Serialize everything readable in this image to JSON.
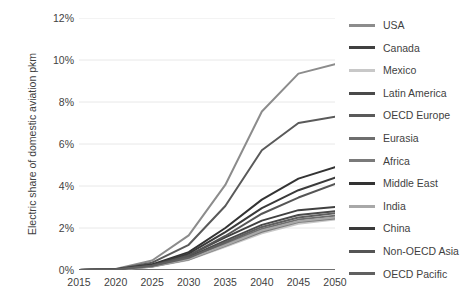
{
  "chart_data": {
    "type": "line",
    "title": "",
    "xlabel": "",
    "ylabel": "Electric share of domestic aviation pkm",
    "x": [
      2015,
      2020,
      2025,
      2030,
      2035,
      2040,
      2045,
      2050
    ],
    "xlim": [
      2015,
      2050
    ],
    "ylim": [
      0,
      12
    ],
    "y_ticks": [
      0,
      2,
      4,
      6,
      8,
      10,
      12
    ],
    "y_tick_labels": [
      "0%",
      "2%",
      "4%",
      "6%",
      "8%",
      "10%",
      "12%"
    ],
    "x_tick_labels": [
      "2015",
      "2020",
      "2025",
      "2030",
      "2035",
      "2040",
      "2045",
      "2050"
    ],
    "grid": "horizontal",
    "legend_position": "right",
    "value_unit": "%",
    "series": [
      {
        "name": "USA",
        "color": "#8c8c8c",
        "values": [
          0,
          0.05,
          0.45,
          1.65,
          4.05,
          7.55,
          9.35,
          9.8
        ]
      },
      {
        "name": "Canada",
        "color": "#404040",
        "values": [
          0,
          0.03,
          0.22,
          0.7,
          1.55,
          2.35,
          2.85,
          3.0
        ]
      },
      {
        "name": "Mexico",
        "color": "#c8c8c8",
        "values": [
          0,
          0.02,
          0.15,
          0.48,
          1.1,
          1.75,
          2.2,
          2.4
        ]
      },
      {
        "name": "Latin America",
        "color": "#4a4a4a",
        "values": [
          0,
          0.03,
          0.2,
          0.62,
          1.4,
          2.15,
          2.62,
          2.8
        ]
      },
      {
        "name": "OECD Europe",
        "color": "#5a5a5a",
        "values": [
          0,
          0.04,
          0.35,
          1.2,
          3.05,
          5.7,
          7.0,
          7.3
        ]
      },
      {
        "name": "Eurasia",
        "color": "#6e6e6e",
        "values": [
          0,
          0.02,
          0.18,
          0.55,
          1.25,
          1.95,
          2.4,
          2.58
        ]
      },
      {
        "name": "Africa",
        "color": "#7a7a7a",
        "values": [
          0,
          0.02,
          0.16,
          0.5,
          1.15,
          1.82,
          2.28,
          2.45
        ]
      },
      {
        "name": "Middle East",
        "color": "#333333",
        "values": [
          0,
          0.03,
          0.26,
          0.85,
          2.0,
          3.35,
          4.35,
          4.9
        ]
      },
      {
        "name": "India",
        "color": "#a8a8a8",
        "values": [
          0,
          0.02,
          0.17,
          0.52,
          1.18,
          1.88,
          2.32,
          2.5
        ]
      },
      {
        "name": "China",
        "color": "#3a3a3a",
        "values": [
          0,
          0.03,
          0.24,
          0.78,
          1.8,
          2.95,
          3.8,
          4.4
        ]
      },
      {
        "name": "Non-OECD Asia",
        "color": "#555555",
        "values": [
          0,
          0.03,
          0.21,
          0.68,
          1.62,
          2.68,
          3.45,
          4.1
        ]
      },
      {
        "name": "OECD Pacific",
        "color": "#606060",
        "values": [
          0,
          0.02,
          0.19,
          0.58,
          1.32,
          2.05,
          2.5,
          2.7
        ]
      }
    ]
  },
  "axis": {
    "y_title": "Electric share of domestic aviation pkm"
  },
  "colors": {
    "gridline": "#e8e8e8",
    "baseline": "#404040",
    "text": "#3f3f3f",
    "background": "#ffffff"
  }
}
